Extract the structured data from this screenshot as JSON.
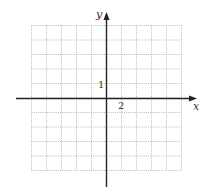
{
  "chart_data": {
    "type": "grid",
    "title": "",
    "xlabel": "x",
    "ylabel": "y",
    "x_tick_label": "2",
    "y_tick_label": "1",
    "grid": true,
    "grid_columns": 10,
    "grid_rows": 10,
    "x_scale_per_cell": 2,
    "y_scale_per_cell": 1,
    "xlim": [
      -10,
      10
    ],
    "ylim": [
      -5,
      5
    ]
  },
  "labels": {
    "x_axis": "x",
    "y_axis": "y",
    "x_tick": "2",
    "y_tick": "1"
  },
  "colors": {
    "grid": "#b8b8b8",
    "axis": "#222222",
    "background": "#ffffff"
  }
}
